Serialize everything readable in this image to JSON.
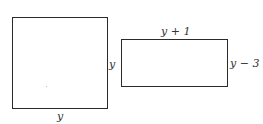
{
  "diagram": {
    "square": {
      "bottom_label": "y",
      "side_label": "y"
    },
    "rectangle": {
      "top_label": "y + 1",
      "side_label": "y − 3"
    },
    "colors": {
      "stroke": "#2a2a2a",
      "text": "#333333",
      "background": "#ffffff"
    }
  }
}
